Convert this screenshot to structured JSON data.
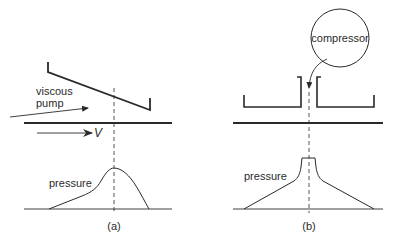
{
  "panel_a": {
    "caption": "(a)",
    "pump_label_line1": "viscous",
    "pump_label_line2": "pump",
    "velocity_label": "V",
    "pressure_label": "pressure"
  },
  "panel_b": {
    "caption": "(b)",
    "compressor_label": "compressor",
    "pressure_label": "pressure"
  },
  "colors": {
    "stroke": "#2a2a2a",
    "background": "#ffffff"
  }
}
